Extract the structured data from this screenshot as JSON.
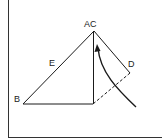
{
  "diagram": {
    "labels": {
      "ac": "AC",
      "b": "B",
      "d": "D",
      "e": "E"
    },
    "colors": {
      "line": "#1a1a1a",
      "frame": "#333333",
      "background": "#ffffff"
    }
  }
}
